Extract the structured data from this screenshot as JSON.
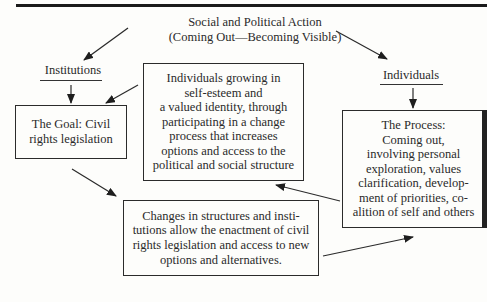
{
  "diagram": {
    "title": {
      "line1": "Social and Political Action",
      "line2": "(Coming Out—Becoming Visible)"
    },
    "left_heading": "Institutions",
    "right_heading": "Individuals",
    "boxes": {
      "goal": {
        "lines": [
          "The Goal: Civil",
          "rights legislation"
        ]
      },
      "individuals_growing": {
        "lines": [
          "Individuals growing in",
          "self-esteem and",
          "a valued identity, through",
          "participating in a change",
          "process that increases",
          "options and access to the",
          "political and social structure"
        ]
      },
      "process": {
        "lines": [
          "The Process:",
          "Coming out,",
          "involving personal",
          "exploration, values",
          "clarification, develop-",
          "ment of priorities, co-",
          "alition of self and others"
        ]
      },
      "changes": {
        "lines": [
          "Changes in structures and insti-",
          "tutions allow the enactment of civil",
          "rights legislation and access to new",
          "options and alternatives."
        ]
      }
    },
    "arrows": [
      {
        "from": "title",
        "to": "institutions"
      },
      {
        "from": "title",
        "to": "individuals"
      },
      {
        "from": "institutions",
        "to": "goal"
      },
      {
        "from": "individuals",
        "to": "process"
      },
      {
        "from": "individuals_growing",
        "to": "goal"
      },
      {
        "from": "goal",
        "to": "changes"
      },
      {
        "from": "changes",
        "to": "process"
      },
      {
        "from": "process",
        "to": "individuals_growing"
      }
    ]
  }
}
